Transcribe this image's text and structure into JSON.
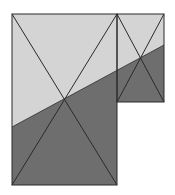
{
  "diagram": {
    "colors": {
      "background": "#ffffff",
      "light_region": "#d4d4d4",
      "dark_region": "#6e6e6e",
      "stroke": "#2a2a2a"
    },
    "large_rect": {
      "x": 12,
      "y": 14,
      "width": 105,
      "height": 171,
      "center": [
        65,
        99
      ]
    },
    "small_rect": {
      "x": 117,
      "y": 14,
      "width": 47,
      "height": 88,
      "center": [
        141,
        58
      ]
    },
    "split_line": {
      "from": [
        12,
        127
      ],
      "to": [
        164,
        45
      ]
    }
  }
}
